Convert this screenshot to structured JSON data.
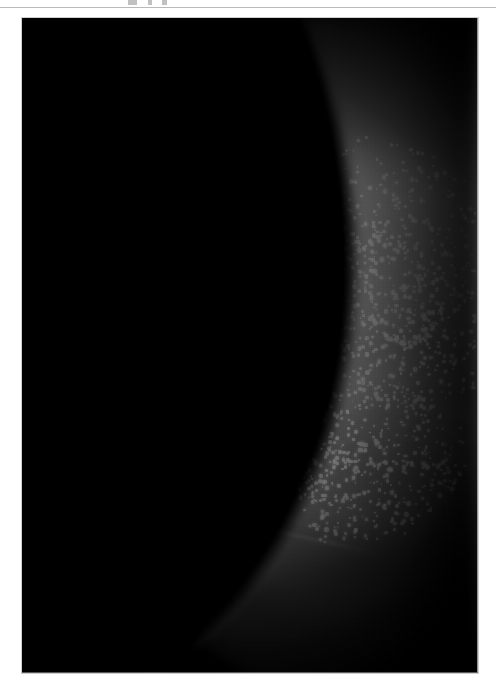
{
  "page": {
    "background_color": "#ffffff",
    "top_artifacts": [
      "cut-off-text-fragment",
      "cut-off-text-fragment",
      "cut-off-text-fragment"
    ],
    "rule_color": "#b9b9b9"
  },
  "figure": {
    "name": "mammogram-radiograph",
    "modality": "mammography",
    "caption": "",
    "frame": {
      "x": 22,
      "y": 18,
      "width": 456,
      "height": 655
    },
    "background_color": "#000000",
    "tissue_color": "#9a9a9a",
    "calcification_color": "#f2f2f2",
    "regions": [
      {
        "name": "air-background",
        "description": "black air field, upper-left and lower-left"
      },
      {
        "name": "skin-line",
        "description": "diagonal air-tissue boundary from upper-centre to lower-left"
      },
      {
        "name": "fibroglandular-tissue",
        "description": "mid-grey parenchyma occupying centre and right"
      },
      {
        "name": "microcalcification-cluster-upper",
        "description": "dense bright punctate cluster, upper-right quadrant"
      },
      {
        "name": "microcalcification-cluster-lower",
        "description": "second dense bright cluster, centre-lower"
      },
      {
        "name": "cooper-ligament-strands",
        "description": "fine bright linear strands across left-mid tissue"
      },
      {
        "name": "dense-falloff",
        "description": "progressive darkening toward right edge and bottom"
      }
    ]
  },
  "chart_data": {
    "type": "heatmap",
    "title": "",
    "xlabel": "",
    "ylabel": "",
    "intensity_range": [
      0,
      255
    ],
    "grid": false,
    "legend": "none",
    "calcification_clusters": [
      {
        "name": "upper-cluster",
        "center_x": 330,
        "center_y": 225,
        "radius_x": 140,
        "radius_y": 105,
        "peak_intensity": 245,
        "density": "high"
      },
      {
        "name": "lower-cluster",
        "center_x": 325,
        "center_y": 440,
        "radius_x": 115,
        "radius_y": 80,
        "peak_intensity": 240,
        "density": "high"
      },
      {
        "name": "bridge-cluster",
        "center_x": 390,
        "center_y": 320,
        "radius_x": 85,
        "radius_y": 70,
        "peak_intensity": 225,
        "density": "moderate"
      }
    ],
    "tissue_intensity_samples": [
      {
        "region": "air-background-left",
        "value": 6
      },
      {
        "region": "skin-edge",
        "value": 70
      },
      {
        "region": "fatty-tissue-mid",
        "value": 120
      },
      {
        "region": "fibroglandular-core",
        "value": 165
      },
      {
        "region": "microcalcification-peak",
        "value": 248
      },
      {
        "region": "right-edge-falloff",
        "value": 30
      },
      {
        "region": "bottom-right-corner",
        "value": 14
      }
    ]
  }
}
